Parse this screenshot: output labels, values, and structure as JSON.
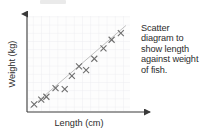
{
  "figure": {
    "title": "",
    "axis_x_label": "Length (cm)",
    "axis_y_label": "Weight (kg)",
    "axis_color": "#3a3a3a",
    "grid_color": "#e6e6ec",
    "marker_color": "#6e6e6e",
    "trendline_color": "#b9b9b9",
    "plot_bg": "#fdfdfd"
  },
  "caption": {
    "line1": "Scatter",
    "line2": "diagram to",
    "line3": "show length",
    "line4": "against weight",
    "line5": "of fish.",
    "full_text": "Scatter diagram to show length against weight of fish."
  },
  "chart_data": {
    "type": "scatter",
    "title": "Scatter diagram to show length against weight of fish.",
    "xlabel": "Length (cm)",
    "ylabel": "Weight (kg)",
    "xlim": [
      0,
      100
    ],
    "ylim": [
      0,
      100
    ],
    "grid": true,
    "axis_ticks": false,
    "legend": "none",
    "points": [
      {
        "x": 6,
        "y": 7
      },
      {
        "x": 13,
        "y": 12
      },
      {
        "x": 18,
        "y": 15
      },
      {
        "x": 27,
        "y": 24
      },
      {
        "x": 36,
        "y": 23
      },
      {
        "x": 43,
        "y": 37
      },
      {
        "x": 50,
        "y": 47
      },
      {
        "x": 57,
        "y": 43
      },
      {
        "x": 65,
        "y": 55
      },
      {
        "x": 74,
        "y": 66
      },
      {
        "x": 82,
        "y": 75
      },
      {
        "x": 91,
        "y": 82
      }
    ],
    "trendline": {
      "x0": 2,
      "y0": 3,
      "x1": 96,
      "y1": 90,
      "style": "solid"
    }
  }
}
